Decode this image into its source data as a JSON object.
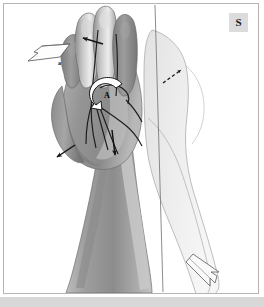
{
  "figure": {
    "domain_kind": "anatomical-illustration",
    "panel_label": "S",
    "background_color": "#ffffff",
    "frame_color": "#b4b4b4",
    "bottom_band_color": "#d8d8d8"
  },
  "labels": {
    "panel": "S",
    "arrow_outline_left_label": "a",
    "arrow_curved_white_label": "A"
  },
  "colors": {
    "skin_mid": "#9a9a9a",
    "skin_dark": "#7c7c7c",
    "skin_light": "#c9c9c9",
    "skin_highlight": "#e4e4e4",
    "ghost_fill": "#e9e9e9",
    "ghost_stroke": "#9d9d9d",
    "line_dark": "#1c1c1c",
    "arrow_black": "#141414",
    "arrow_white_fill": "#ffffff",
    "arrow_white_stroke": "#1c1c1c",
    "axis_line": "#6f6f6f"
  },
  "annotations": [
    {
      "id": "arrow-outline-left",
      "name": "outline-arrow-left",
      "style": "hollow-outline",
      "direction": "left",
      "label": "a",
      "description": "Open outlined arrow at upper left pointing left, labelled a"
    },
    {
      "id": "arrow-black-fingers",
      "name": "solid-arrow-fingers",
      "style": "solid-black",
      "direction": "left",
      "label": "",
      "description": "Solid black arrow over the index finger pointing left"
    },
    {
      "id": "arrow-white-curved",
      "name": "curved-rotation-arrow",
      "style": "white-filled-curved",
      "direction": "counterclockwise",
      "label": "A",
      "description": "White curved rotation arrow at the palm centre labelled A"
    },
    {
      "id": "arrow-black-wrist",
      "name": "solid-arrow-wrist",
      "style": "solid-black",
      "direction": "down-left",
      "label": "",
      "description": "Solid black arrow at lower left of the wrist pointing down-left"
    },
    {
      "id": "arrow-black-palm",
      "name": "solid-arrow-palm",
      "style": "solid-black",
      "direction": "down",
      "label": "",
      "description": "Solid black arrow in mid palm pointing down"
    },
    {
      "id": "arrow-dashed-upright",
      "name": "dashed-arrow-up-right",
      "style": "dashed",
      "direction": "up-right",
      "label": "",
      "description": "Small dashed arrow to the right of the limb pointing up-right"
    },
    {
      "id": "arrow-outline-bottom",
      "name": "outline-arrow-down-right",
      "style": "hollow-outline",
      "direction": "down-right",
      "label": "",
      "description": "Large open outlined arrow at the bottom pointing down-right"
    }
  ],
  "graphics": {
    "axis_line": {
      "name": "rotation-axis-line",
      "description": "Thin near-vertical reference line running the full height of the panel"
    },
    "ghost_limb": {
      "name": "ghost-limb-overlay",
      "description": "Pale translucent silhouette of the forearm and hand in the rotated position"
    },
    "primary_limb": {
      "name": "forearm-and-hand",
      "description": "Shaded forearm with wrist, palm and four flexed fingers plus thumb"
    },
    "tendons": {
      "name": "tendon-lines",
      "description": "Dark curved lines radiating across the palm and fingers"
    }
  }
}
